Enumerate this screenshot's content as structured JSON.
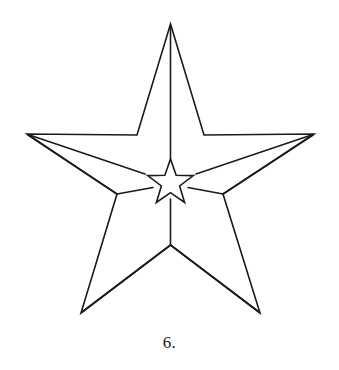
{
  "figure": {
    "caption": "6.",
    "background_color": "#ffffff",
    "stroke_color": "#1a1a1a",
    "stroke_width": 1.6,
    "canvas": {
      "width": 339,
      "height": 370
    }
  },
  "geometry": {
    "outer_star": {
      "type": "5-point-star-outline",
      "center": {
        "x": 170.5,
        "y": 160
      },
      "outer_points": [
        {
          "name": "top",
          "x": 170.5,
          "y": 24
        },
        {
          "name": "right",
          "x": 314,
          "y": 134
        },
        {
          "name": "bottom-right",
          "x": 260,
          "y": 313
        },
        {
          "name": "bottom-left",
          "x": 81,
          "y": 313
        },
        {
          "name": "left",
          "x": 27,
          "y": 134
        }
      ],
      "inner_vertices": [
        {
          "name": "upper-right",
          "x": 204,
          "y": 135
        },
        {
          "name": "right-low",
          "x": 223,
          "y": 194
        },
        {
          "name": "bottom",
          "x": 170.5,
          "y": 245
        },
        {
          "name": "left-low",
          "x": 117,
          "y": 194
        },
        {
          "name": "upper-left",
          "x": 137,
          "y": 135
        }
      ]
    },
    "inner_star": {
      "type": "5-point-star-outline",
      "center": {
        "x": 170.5,
        "y": 183
      },
      "outer_radius": 24,
      "inner_radius": 9.6,
      "outer_points": [
        {
          "name": "top",
          "x": 170.5,
          "y": 159
        },
        {
          "name": "right",
          "x": 193.3,
          "y": 175.6
        },
        {
          "name": "bottom-right",
          "x": 184.6,
          "y": 202.4
        },
        {
          "name": "bottom-left",
          "x": 156.4,
          "y": 202.4
        },
        {
          "name": "left",
          "x": 147.7,
          "y": 175.6
        }
      ]
    },
    "connector_lines": [
      {
        "name": "apex-to-inner-top",
        "from": {
          "x": 170.5,
          "y": 24
        },
        "to": {
          "x": 170.5,
          "y": 159
        }
      },
      {
        "name": "inner-bottom-to-junction",
        "from": {
          "x": 170.5,
          "y": 203
        },
        "to": {
          "x": 170.5,
          "y": 245
        }
      },
      {
        "name": "left-point-to-inner-left",
        "from": {
          "x": 27,
          "y": 134
        },
        "to": {
          "x": 145,
          "y": 174
        }
      },
      {
        "name": "left-point-to-left-low",
        "from": {
          "x": 27,
          "y": 134
        },
        "to": {
          "x": 117,
          "y": 194
        }
      },
      {
        "name": "right-point-to-inner-right",
        "from": {
          "x": 314,
          "y": 134
        },
        "to": {
          "x": 196,
          "y": 174
        }
      },
      {
        "name": "right-point-to-right-low",
        "from": {
          "x": 314,
          "y": 134
        },
        "to": {
          "x": 223,
          "y": 194
        }
      },
      {
        "name": "left-low-to-inner-bl",
        "from": {
          "x": 117,
          "y": 194
        },
        "to": {
          "x": 152,
          "y": 188
        }
      },
      {
        "name": "right-low-to-inner-br",
        "from": {
          "x": 223,
          "y": 194
        },
        "to": {
          "x": 189,
          "y": 188
        }
      },
      {
        "name": "junction-to-bottom-left",
        "from": {
          "x": 170.5,
          "y": 245
        },
        "to": {
          "x": 81,
          "y": 313
        }
      },
      {
        "name": "junction-to-bottom-right",
        "from": {
          "x": 170.5,
          "y": 245
        },
        "to": {
          "x": 260,
          "y": 313
        }
      }
    ]
  }
}
